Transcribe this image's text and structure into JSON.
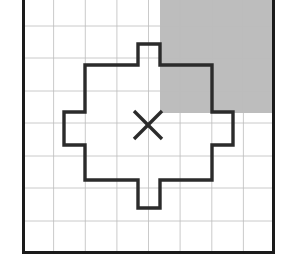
{
  "figure": {
    "type": "grid-diagram",
    "canvas": {
      "width": 292,
      "height": 270
    },
    "colors": {
      "background": "#ffffff",
      "grid_line": "#b9b9b9",
      "border": "#1a1a1a",
      "shaded_region": "#bdbdbd",
      "polygon_stroke": "#2b2b2b",
      "polygon_fill": "none",
      "marker": "#2b2b2b"
    },
    "panel": {
      "name": "grid-panel",
      "left": 22,
      "top": -6,
      "right": 275,
      "bottom": 254,
      "border_width": 3
    },
    "grid": {
      "columns": 8,
      "rows": 8,
      "cell_width": 31.6,
      "cell_height": 32.5,
      "line_width": 0.8,
      "visible": true
    },
    "shaded_region": {
      "name": "shaded-quadrant",
      "label": "upper-right shaded quadrant",
      "x": 160,
      "y": -6,
      "width": 115,
      "height": 119
    },
    "marker": {
      "name": "x-marker",
      "glyph": "X",
      "center_x": 148,
      "center_y": 125,
      "arm": 14,
      "stroke_width": 3.4
    },
    "polygon": {
      "name": "cross-polygon",
      "stroke_width": 3.4,
      "points": "138,44 160,44 160,65 212,65 212,112 233,112 233,145 212,145 212,180 160,180 160,208 138,208 138,180 85,180 85,145 64,145 64,112 85,112 85,65 138,65"
    }
  }
}
